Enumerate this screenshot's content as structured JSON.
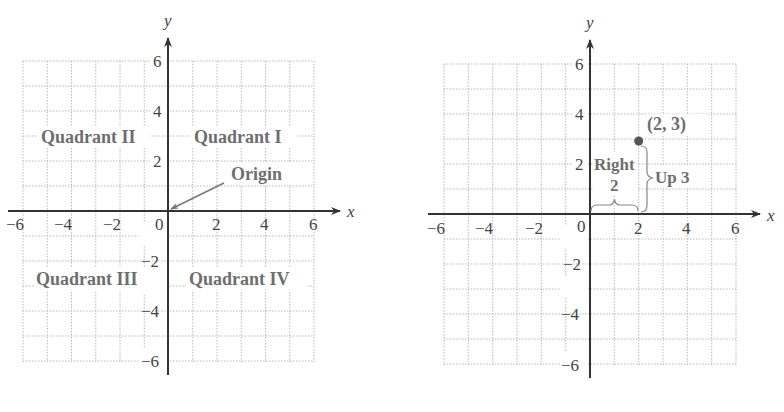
{
  "left_graph": {
    "x_axis_label": "x",
    "y_axis_label": "y",
    "x_ticks": [
      "−6",
      "−4",
      "−2",
      "0",
      "2",
      "4",
      "6"
    ],
    "y_ticks_pos": [
      "6",
      "4",
      "2"
    ],
    "y_ticks_neg": [
      "−2",
      "−4",
      "−6"
    ],
    "quadrants": {
      "q1": "Quadrant I",
      "q2": "Quadrant II",
      "q3": "Quadrant III",
      "q4": "Quadrant IV"
    },
    "origin_label": "Origin"
  },
  "right_graph": {
    "x_axis_label": "x",
    "y_axis_label": "y",
    "x_ticks": [
      "−6",
      "−4",
      "−2",
      "0",
      "2",
      "4",
      "6"
    ],
    "y_ticks_pos": [
      "6",
      "4",
      "2"
    ],
    "y_ticks_neg": [
      "−2",
      "−4",
      "−6"
    ],
    "point_label": "(2, 3)",
    "right_label_line1": "Right",
    "right_label_line2": "2",
    "up_label": "Up 3"
  },
  "colors": {
    "axis": "#333333",
    "grid": "#b8b8b8",
    "label_gray": "#6e6e6e",
    "point": "#555555"
  }
}
